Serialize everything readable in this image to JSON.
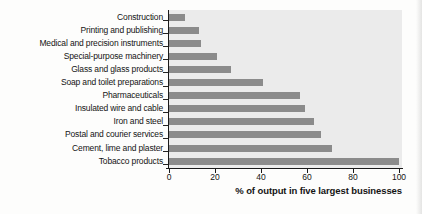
{
  "chart_data": {
    "type": "bar",
    "orientation": "horizontal",
    "title": "",
    "categories": [
      "Construction",
      "Printing and publishing",
      "Medical and precision instruments",
      "Special-purpose machinery",
      "Glass and glass products",
      "Soap and toilet preparations",
      "Pharmaceuticals",
      "Insulated wire and cable",
      "Iron and steel",
      "Postal and courier services",
      "Cement, lime and plaster",
      "Tobacco products"
    ],
    "values": [
      7,
      13,
      14,
      21,
      27,
      41,
      57,
      59,
      63,
      66,
      71,
      100
    ],
    "xlabel": "% of output in five largest businesses",
    "x_ticks": [
      0,
      20,
      40,
      60,
      80,
      100
    ],
    "xlim": [
      0,
      100
    ],
    "grid": false,
    "legend": false,
    "bar_color": "#8b8b8b",
    "plot_bg": "#ebebeb",
    "axis_color": "#1a1a1a"
  }
}
